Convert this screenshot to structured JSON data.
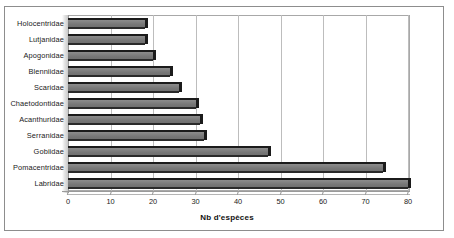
{
  "chart_data": {
    "type": "bar",
    "orientation": "horizontal",
    "title": "",
    "xlabel": "Nb d'espèces",
    "ylabel": "",
    "xlim": [
      0,
      80
    ],
    "xticks": [
      0,
      10,
      20,
      30,
      40,
      50,
      60,
      70,
      80
    ],
    "grid": true,
    "legend": false,
    "categories": [
      "Holocentridae",
      "Lutjanidae",
      "Apogonidae",
      "Blenniidae",
      "Scaridae",
      "Chaetodontidae",
      "Acanthuridae",
      "Serranidae",
      "Gobiidae",
      "Pomacentridae",
      "Labridae"
    ],
    "values": [
      18,
      18,
      20,
      24,
      26,
      30,
      31,
      32,
      47,
      74,
      80
    ],
    "bar_face_color": "#7a7a7a",
    "bar_edge_color": "#1b1b1b",
    "background_color": "#ffffff",
    "grid_color": "#bdbdbd"
  }
}
